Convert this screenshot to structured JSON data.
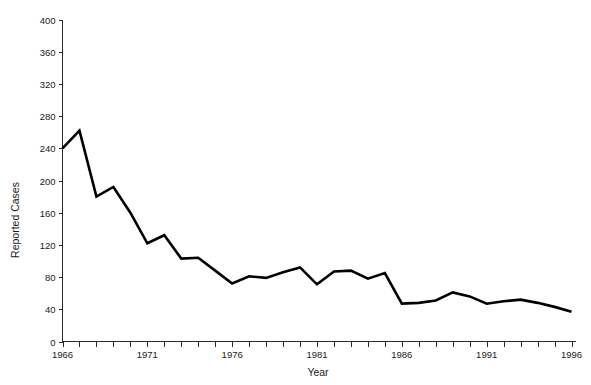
{
  "chart_data": {
    "type": "line",
    "title": "",
    "subtitle": "",
    "xlabel": "Year",
    "ylabel": "Reported Cases",
    "xlim": [
      1966,
      1996
    ],
    "ylim": [
      0,
      400
    ],
    "grid": false,
    "legend": null,
    "legend_position": "none",
    "x_tick_interval": 1,
    "x_label_interval": 5,
    "y_tick_interval": 40,
    "x_tick_labels": [
      "1966",
      "1971",
      "1976",
      "1981",
      "1986",
      "1991",
      "1996"
    ],
    "x_tick_label_values": [
      1966,
      1971,
      1976,
      1981,
      1986,
      1991,
      1996
    ],
    "y_tick_labels": [
      "0",
      "40",
      "80",
      "120",
      "160",
      "200",
      "240",
      "280",
      "320",
      "360",
      "400"
    ],
    "y_tick_values": [
      0,
      40,
      80,
      120,
      160,
      200,
      240,
      280,
      320,
      360,
      400
    ],
    "x": [
      1966,
      1967,
      1968,
      1969,
      1970,
      1971,
      1972,
      1973,
      1974,
      1975,
      1976,
      1977,
      1978,
      1979,
      1980,
      1981,
      1982,
      1983,
      1984,
      1985,
      1986,
      1987,
      1988,
      1989,
      1990,
      1991,
      1992,
      1993,
      1994,
      1995,
      1996
    ],
    "values": [
      240,
      262,
      180,
      192,
      160,
      122,
      132,
      103,
      104,
      88,
      72,
      81,
      79,
      86,
      92,
      71,
      87,
      88,
      78,
      85,
      47,
      48,
      51,
      61,
      56,
      47,
      50,
      52,
      48,
      43,
      37
    ],
    "series": [
      {
        "name": "Reported Cases",
        "color": "#000000",
        "values": [
          240,
          262,
          180,
          192,
          160,
          122,
          132,
          103,
          104,
          88,
          72,
          81,
          79,
          86,
          92,
          71,
          87,
          88,
          78,
          85,
          47,
          48,
          51,
          61,
          56,
          47,
          50,
          52,
          48,
          43,
          37
        ]
      }
    ],
    "annotations": []
  },
  "colors": {
    "line": "#000000",
    "axis": "#2b2b2b",
    "text": "#1a1a1a",
    "background": "#ffffff"
  }
}
